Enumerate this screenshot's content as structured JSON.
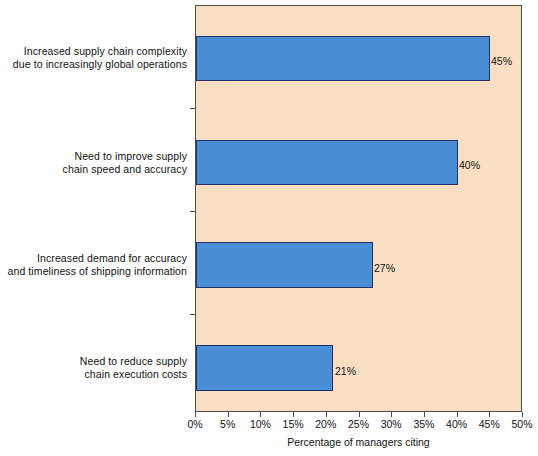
{
  "chart_data": {
    "type": "bar",
    "orientation": "horizontal",
    "title": "",
    "xlabel": "Percentage of managers citing",
    "ylabel": "",
    "xlim": [
      0,
      50
    ],
    "grid": false,
    "legend": null,
    "categories": [
      "Increased supply chain complexity due to increasingly global operations",
      "Need to improve supply chain speed and accuracy",
      "Increased demand for accuracy and timeliness of shipping information",
      "Need to reduce supply chain execution costs"
    ],
    "values": [
      45,
      40,
      27,
      21
    ],
    "data_labels": [
      "45%",
      "40%",
      "27%",
      "21%"
    ],
    "xticks": [
      0,
      5,
      10,
      15,
      20,
      25,
      30,
      35,
      40,
      45,
      50
    ],
    "xtick_labels": [
      "0%",
      "5%",
      "10%",
      "15%",
      "20%",
      "25%",
      "30%",
      "35%",
      "40%",
      "45%",
      "50%"
    ],
    "colors": {
      "bar_fill": "#4a8fd5",
      "bar_border": "#22336b",
      "plot_background": "#f8dfc3",
      "axis_line": "#4d4d4d",
      "text": "#121212",
      "page_background": "#ffffff"
    }
  },
  "categories_wrapped": [
    [
      "Increased supply chain complexity",
      "due to increasingly global operations"
    ],
    [
      "Need to improve supply",
      "chain speed and accuracy"
    ],
    [
      "Increased demand for accuracy",
      "and timeliness of shipping information"
    ],
    [
      "Need to reduce supply",
      "chain execution costs"
    ]
  ],
  "axis": {
    "x_title": "Percentage of managers citing"
  }
}
